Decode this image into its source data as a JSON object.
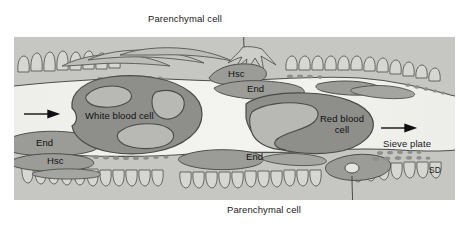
{
  "figure": {
    "type": "biological-diagram",
    "panel": {
      "x": 14,
      "y": 37,
      "width": 441,
      "height": 163
    },
    "colors": {
      "background": "#ffffff",
      "panel_light": "#e9e9e7",
      "panel_mid": "#cfcfcc",
      "panel_dark": "#a9a9a6",
      "lumen": "#efefec",
      "cell_fill": "#8e8e8b",
      "cell_fill_light": "#b5b5b1",
      "wall_fill": "#b9b9b5",
      "outline": "#4a4a48",
      "label_text": "#1a1a1a"
    }
  },
  "labels": {
    "parenchymal_top": "Parenchymal cell",
    "parenchymal_bottom": "Parenchymal cell",
    "white_blood_cell": "White blood cell",
    "red_blood_cell_line1": "Red blood",
    "red_blood_cell_line2": "cell",
    "sieve_plate": "Sieve plate",
    "sd": "SD",
    "hsc_top": "Hsc",
    "hsc_bottom": "Hsc",
    "end_top": "End",
    "end_left": "End",
    "end_bottom": "End"
  },
  "arrows": [
    {
      "name": "flow-arrow-left",
      "direction": "right",
      "x": 24,
      "y": 114
    },
    {
      "name": "flow-arrow-right",
      "direction": "right",
      "x": 381,
      "y": 128
    }
  ],
  "annotations": {
    "leader_top": {
      "from": "Parenchymal cell",
      "to": "parenchymal tissue above sinusoid"
    },
    "leader_bottom": {
      "from": "Parenchymal cell",
      "to": "parenchymal tissue below sinusoid"
    }
  }
}
